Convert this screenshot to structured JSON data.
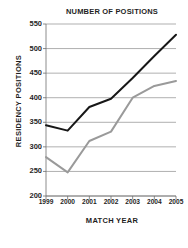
{
  "chart_data": {
    "type": "line",
    "title": "NUMBER OF POSITIONS",
    "xlabel": "MATCH YEAR",
    "ylabel": "RESIDENCY POSITIONS",
    "categories": [
      "1999",
      "2000",
      "2001",
      "2002",
      "2003",
      "2004",
      "2005"
    ],
    "x": [
      1999,
      2000,
      2001,
      2002,
      2003,
      2004,
      2005
    ],
    "ylim": [
      200,
      550
    ],
    "yticks": [
      200,
      250,
      300,
      350,
      400,
      450,
      500,
      550
    ],
    "ytick_labels": [
      "200",
      "250",
      "300",
      "350",
      "400",
      "450",
      "500",
      "550"
    ],
    "grid": true,
    "legend": "none",
    "series": [
      {
        "name": "positions-offered",
        "color": "#171717",
        "values": [
          344,
          333,
          381,
          398,
          440,
          485,
          528
        ]
      },
      {
        "name": "positions-filled",
        "color": "#9a9a9a",
        "values": [
          279,
          248,
          312,
          331,
          400,
          424,
          434
        ]
      }
    ]
  },
  "chart": {
    "title": "NUMBER OF POSITIONS",
    "xlabel": "MATCH YEAR",
    "ylabel": "RESIDENCY POSITIONS"
  },
  "footer": {
    "note": ""
  }
}
